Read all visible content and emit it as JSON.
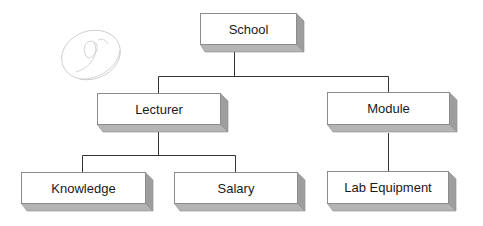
{
  "diagram": {
    "type": "hierarchy",
    "colors": {
      "face": "#ffffff",
      "border": "#8c8c8c",
      "shade_bottom": "#b4b4b4",
      "shade_right": "#9e9e9e",
      "line": "#333333",
      "text": "#1a1a1a"
    },
    "nodes": {
      "school": {
        "label": "School",
        "x": 200,
        "y": 13,
        "w": 96,
        "h": 31
      },
      "lecturer": {
        "label": "Lecturer",
        "x": 97,
        "y": 93,
        "w": 123,
        "h": 31
      },
      "module": {
        "label": "Module",
        "x": 327,
        "y": 92,
        "w": 122,
        "h": 32
      },
      "knowledge": {
        "label": "Knowledge",
        "x": 21,
        "y": 172,
        "w": 124,
        "h": 31
      },
      "salary": {
        "label": "Salary",
        "x": 174,
        "y": 172,
        "w": 123,
        "h": 31
      },
      "lab_equipment": {
        "label": "Lab Equipment",
        "x": 327,
        "y": 171,
        "w": 121,
        "h": 32
      }
    },
    "edges": [
      {
        "from": "School",
        "to": "Lecturer"
      },
      {
        "from": "School",
        "to": "Module"
      },
      {
        "from": "Lecturer",
        "to": "Knowledge"
      },
      {
        "from": "Lecturer",
        "to": "Salary"
      },
      {
        "from": "Module",
        "to": "Lab Equipment"
      }
    ],
    "watermark": {
      "glyph": "handwritten-signature-mark"
    }
  }
}
